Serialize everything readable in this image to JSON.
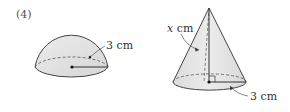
{
  "problem": {
    "number": "(4)"
  },
  "hemisphere": {
    "radius_label": "3 cm"
  },
  "cone": {
    "slant_var": "x",
    "slant_unit": " cm",
    "radius_label": "3 cm"
  },
  "colors": {
    "fill": "#e4e4e4",
    "stroke": "#444444",
    "text": "#333333"
  }
}
